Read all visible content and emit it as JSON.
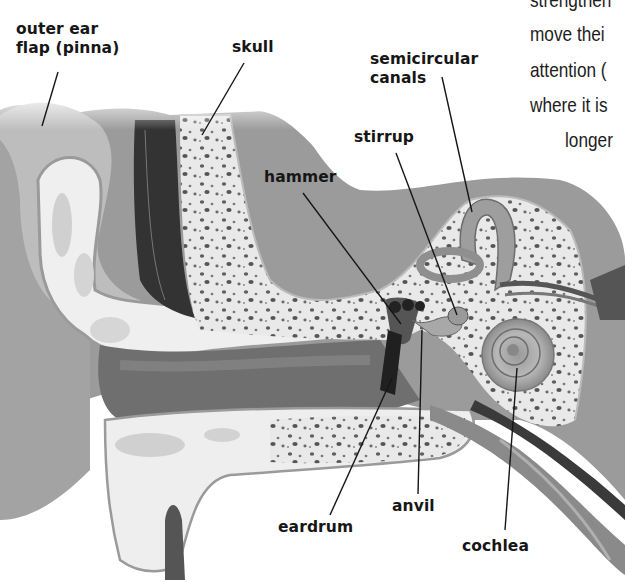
{
  "figure": {
    "labels": [
      {
        "id": "pinna",
        "text_line1": "outer ear",
        "text_line2": "flap (pinna)"
      },
      {
        "id": "skull",
        "text": "skull"
      },
      {
        "id": "semicircular",
        "text_line1": "semicircular",
        "text_line2": "canals"
      },
      {
        "id": "stirrup",
        "text": "stirrup"
      },
      {
        "id": "hammer",
        "text": "hammer"
      },
      {
        "id": "anvil",
        "text": "anvil"
      },
      {
        "id": "eardrum",
        "text": "eardrum"
      },
      {
        "id": "cochlea",
        "text": "cochlea"
      }
    ]
  },
  "body_text_fragments": [
    "strengthen",
    "move thei",
    "attention (",
    "where it is",
    "longer"
  ]
}
